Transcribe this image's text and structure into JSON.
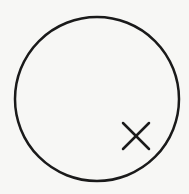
{
  "diagram": {
    "background": "#f7f7f5",
    "stroke": "#1a1a1a",
    "circle": {
      "cx": 97,
      "cy": 99,
      "r": 82,
      "stroke_width": 2.5
    },
    "mark": {
      "type": "x-mark",
      "x1": 123,
      "y1": 123,
      "x2": 149,
      "y2": 149,
      "stroke_width": 2.5
    }
  }
}
